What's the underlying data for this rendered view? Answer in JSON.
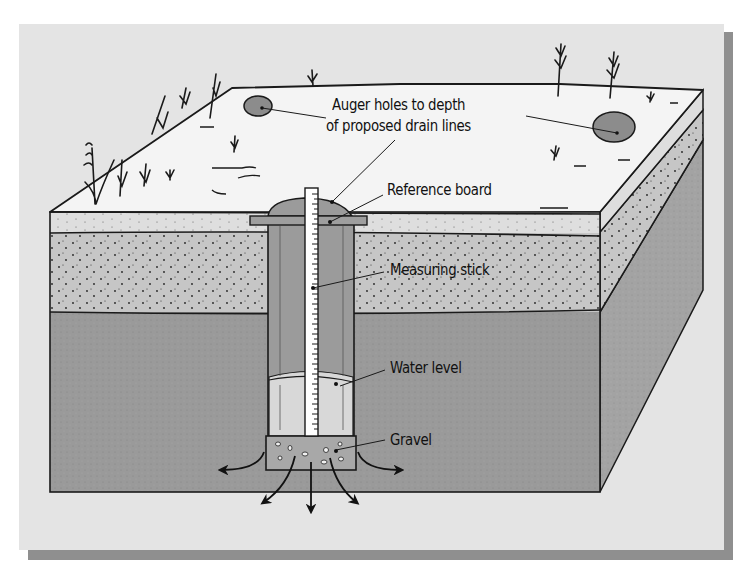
{
  "diagram": {
    "labels": {
      "auger_holes_line1": "Auger holes to depth",
      "auger_holes_line2": "of proposed drain lines",
      "reference_board": "Reference board",
      "measuring_stick": "Measuring stick",
      "water_level": "Water level",
      "gravel": "Gravel"
    },
    "colors": {
      "background": "#ffffff",
      "panel": "#e4e4e4",
      "panel_shadow": "#8f8f8f",
      "ground_surface": "#f4f4f4",
      "sand_band": "#dedede",
      "dotted_layer": "#c6c6c6",
      "subsoil": "#9a9a9a",
      "side_subsoil": "#a3a3a3",
      "hole_fill": "#8c8c8c",
      "pipe_upper": "#9b9b9b",
      "pipe_water": "#d8d8d8",
      "stick": "#ffffff",
      "gravel": "#a8a8a8",
      "ink": "#1a1a1a"
    },
    "layers": [
      "Ground surface",
      "Sandy topsoil",
      "Dotted soil layer",
      "Subsoil"
    ],
    "flow_arrows": 5
  }
}
